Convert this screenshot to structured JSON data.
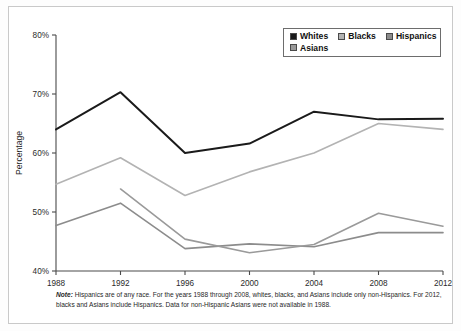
{
  "chart_data": {
    "type": "line",
    "title": "",
    "xlabel": "",
    "ylabel": "Percentage",
    "x": [
      1988,
      1992,
      1996,
      2000,
      2004,
      2008,
      2012
    ],
    "xticklabels": [
      "1988",
      "1992",
      "1996",
      "2000",
      "2004",
      "2008",
      "2012"
    ],
    "yticklabels": [
      "40%",
      "50%",
      "60%",
      "70%",
      "80%"
    ],
    "yticks": [
      40,
      50,
      60,
      70,
      80
    ],
    "ylim": [
      40,
      80
    ],
    "xlim": [
      1988,
      2012
    ],
    "grid": false,
    "legend_position": "top-right",
    "series": [
      {
        "name": "Whites",
        "color": "#1a1a1a",
        "width": 2.0,
        "values": [
          64.0,
          70.3,
          60.0,
          61.6,
          67.0,
          65.7,
          65.8
        ]
      },
      {
        "name": "Blacks",
        "color": "#b3b3b3",
        "width": 1.6,
        "values": [
          54.7,
          59.2,
          52.8,
          56.8,
          60.0,
          65.0,
          64.0
        ]
      },
      {
        "name": "Hispanics",
        "color": "#8c8c8c",
        "width": 1.6,
        "values": [
          47.7,
          51.5,
          43.8,
          44.6,
          44.1,
          46.5,
          46.5
        ]
      },
      {
        "name": "Asians",
        "color": "#9a9a9a",
        "width": 1.6,
        "values": [
          null,
          53.9,
          45.4,
          43.1,
          44.5,
          49.8,
          47.6
        ]
      }
    ]
  },
  "legend": {
    "rows": [
      [
        {
          "label": "Whites",
          "color": "#1a1a1a"
        },
        {
          "label": "Blacks",
          "color": "#b3b3b3"
        },
        {
          "label": "Hispanics",
          "color": "#8c8c8c"
        }
      ],
      [
        {
          "label": "Asians",
          "color": "#9a9a9a"
        }
      ]
    ]
  },
  "note": {
    "word": "Note:",
    "text": " Hispanics are of any race. For the years 1988 through 2008, whites, blacks, and Asians include only non-Hispanics. For 2012, blacks and Asians include Hispanics. Data for non-Hispanic Asians were not available in 1988."
  }
}
